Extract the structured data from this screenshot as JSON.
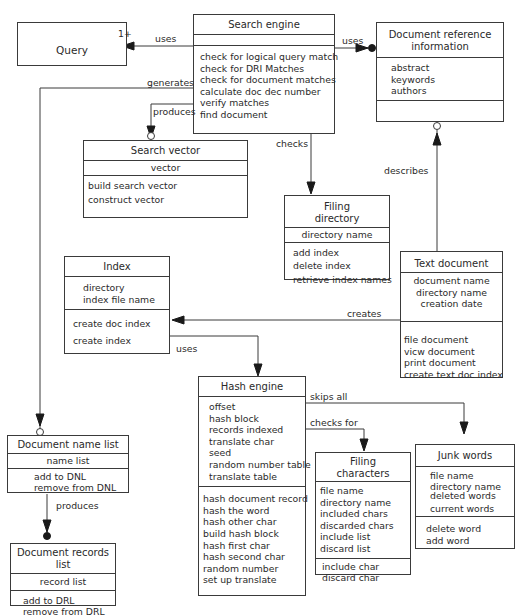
{
  "diagram": {
    "type": "UML class diagram",
    "classes": {
      "query": {
        "name": "Query"
      },
      "search_engine": {
        "name": "Search engine",
        "attributes": [],
        "operations": [
          "check for logical query match",
          "check for DRI Matches",
          "check for document matches",
          "calculate doc dec number",
          "verify matches",
          "find document"
        ]
      },
      "dri": {
        "name_line1": "Document reference",
        "name_line2": "information",
        "attributes": [
          "abstract",
          "keywords",
          "authors"
        ],
        "operations": []
      },
      "search_vector": {
        "name": "Search vector",
        "attributes": [
          "vector"
        ],
        "operations": [
          "build search vector",
          "construct vector"
        ]
      },
      "filing_directory": {
        "name_line1": "Filing",
        "name_line2": "directory",
        "attributes": [
          "directory name"
        ],
        "operations": [
          "add index",
          "delete index",
          "retrieve index names"
        ]
      },
      "index": {
        "name": "Index",
        "attributes": [
          "directory",
          "index file name"
        ],
        "operations": [
          "create doc index",
          "create index"
        ]
      },
      "text_document": {
        "name": "Text document",
        "attributes": [
          "document name",
          "directory name",
          "creation date"
        ],
        "operations": [
          "file document",
          "vicw document",
          "print document",
          "create text doc index"
        ]
      },
      "hash_engine": {
        "name": "Hash engine",
        "attributes": [
          "offset",
          "hash block",
          "records indexed",
          "translate char",
          "seed",
          "random number table",
          "translate table"
        ],
        "operations": [
          "hash document record",
          "hash the word",
          "hash other char",
          "build hash block",
          "hash first char",
          "hash second char",
          "random number",
          "set up translate"
        ]
      },
      "document_name_list": {
        "name": "Document name list",
        "attributes": [
          "name list"
        ],
        "operations": [
          "add to DNL",
          "remove from DNL"
        ]
      },
      "document_records_list": {
        "name": "Document records list",
        "attributes": [
          "record list"
        ],
        "operations": [
          "add to DRL",
          "remove from DRL"
        ]
      },
      "filing_characters": {
        "name_line1": "Filing",
        "name_line2": "characters",
        "attributes": [
          "file name",
          "directory name",
          "included chars",
          "discarded chars",
          "include list",
          "discard list"
        ],
        "operations": [
          "include char",
          "discard char"
        ]
      },
      "junk_words": {
        "name": "Junk words",
        "attributes": [
          "file name",
          "directory name",
          "deleted words",
          "current words"
        ],
        "operations": [
          "delete word",
          "add word"
        ]
      }
    },
    "relationships": {
      "uses_query": {
        "label": "uses",
        "multiplicity": "1+"
      },
      "uses_dri": {
        "label": "uses"
      },
      "generates": {
        "label": "generates"
      },
      "produces_vector": {
        "label": "produces"
      },
      "checks": {
        "label": "checks"
      },
      "describes": {
        "label": "describes"
      },
      "creates": {
        "label": "creates"
      },
      "uses_hash": {
        "label": "uses"
      },
      "skips_all": {
        "label": "skips all"
      },
      "checks_for": {
        "label": "checks for"
      },
      "produces_drl": {
        "label": "produces"
      }
    }
  }
}
